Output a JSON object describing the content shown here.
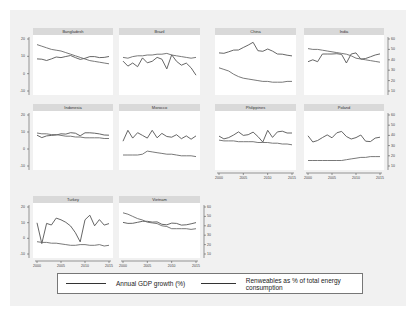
{
  "chart_data": {
    "type": "line",
    "title": "",
    "layout": "small multiples, 4 columns x 3 rows, dual y-axes",
    "x": [
      2000,
      2001,
      2002,
      2003,
      2004,
      2005,
      2006,
      2007,
      2008,
      2009,
      2010,
      2011,
      2012,
      2013,
      2014,
      2015
    ],
    "xticks": [
      "2000",
      "2005",
      "2010",
      "2015"
    ],
    "left_yticks": [
      "20",
      "10",
      "0",
      "-10"
    ],
    "right_yticks": [
      "60",
      "50",
      "40",
      "30",
      "20",
      "10"
    ],
    "legend": {
      "position": "bottom",
      "entries": [
        "Annual GDP growth (%)",
        "Renweables as % of total energy consumption"
      ]
    },
    "panels": [
      {
        "name": "Bangladesh",
        "series": [
          {
            "name": "Annual GDP growth (%)",
            "values": [
              5.3,
              5.1,
              4.4,
              5.3,
              6.3,
              6.0,
              6.6,
              7.1,
              6.0,
              5.0,
              5.6,
              6.5,
              6.5,
              6.0,
              6.1,
              6.6
            ]
          },
          {
            "name": "Renweables as % of total energy consumption",
            "values": [
              58,
              56,
              54,
              52,
              51,
              50,
              48,
              46,
              44,
              42,
              40,
              38,
              37,
              36,
              35,
              34
            ]
          }
        ]
      },
      {
        "name": "Brazil",
        "series": [
          {
            "name": "Annual GDP growth (%)",
            "values": [
              4.1,
              1.4,
              3.1,
              1.1,
              5.8,
              3.2,
              4.0,
              6.1,
              5.1,
              -0.1,
              7.5,
              4.0,
              1.9,
              3.0,
              0.5,
              -3.5
            ]
          },
          {
            "name": "Renweables as % of total energy consumption",
            "values": [
              42,
              41,
              43,
              44,
              44,
              45,
              45,
              46,
              46,
              47,
              45,
              44,
              43,
              42,
              41,
              42
            ]
          }
        ]
      },
      {
        "name": "China",
        "series": [
          {
            "name": "Annual GDP growth (%)",
            "values": [
              8.5,
              8.3,
              9.1,
              10.0,
              10.1,
              11.4,
              12.7,
              14.2,
              9.7,
              9.4,
              10.6,
              9.5,
              7.9,
              7.8,
              7.3,
              6.9
            ]
          },
          {
            "name": "Renweables as % of total energy consumption",
            "values": [
              29,
              27,
              25,
              21,
              18,
              16,
              15,
              14,
              13,
              12,
              12,
              11,
              11,
              11,
              12,
              12
            ]
          }
        ]
      },
      {
        "name": "India",
        "series": [
          {
            "name": "Annual GDP growth (%)",
            "values": [
              3.8,
              4.8,
              3.8,
              7.9,
              7.9,
              7.9,
              8.1,
              7.7,
              3.1,
              7.9,
              8.5,
              5.2,
              5.5,
              6.4,
              7.4,
              8.0
            ]
          },
          {
            "name": "Renweables as % of total energy consumption",
            "values": [
              53,
              52,
              52,
              51,
              50,
              49,
              48,
              47,
              46,
              44,
              41,
              40,
              39,
              38,
              37,
              36
            ]
          }
        ]
      },
      {
        "name": "Indonesia",
        "series": [
          {
            "name": "Annual GDP growth (%)",
            "values": [
              4.9,
              3.6,
              4.5,
              4.8,
              5.0,
              5.7,
              5.5,
              6.3,
              6.0,
              4.6,
              6.2,
              6.2,
              6.0,
              5.6,
              5.0,
              4.9
            ]
          },
          {
            "name": "Renweables as % of total energy consumption",
            "values": [
              42,
              41,
              41,
              40,
              40,
              39,
              38,
              38,
              37,
              37,
              36,
              36,
              36,
              36,
              35,
              35
            ]
          }
        ]
      },
      {
        "name": "Morocco",
        "series": [
          {
            "name": "Annual GDP growth (%)",
            "values": [
              1.6,
              7.6,
              3.3,
              6.3,
              4.8,
              3.3,
              7.6,
              3.5,
              5.9,
              4.2,
              3.8,
              5.2,
              3.0,
              4.5,
              2.7,
              4.5
            ]
          },
          {
            "name": "Renweables as % of total energy consumption",
            "values": [
              14,
              14,
              14,
              14,
              15,
              19,
              18,
              17,
              16,
              15,
              15,
              14,
              13,
              13,
              13,
              12
            ]
          }
        ]
      },
      {
        "name": "Philippines",
        "series": [
          {
            "name": "Annual GDP growth (%)",
            "values": [
              4.4,
              2.9,
              3.6,
              5.0,
              6.7,
              4.8,
              5.2,
              6.6,
              4.2,
              1.1,
              7.6,
              3.7,
              6.7,
              7.1,
              6.1,
              6.1
            ]
          },
          {
            "name": "Renweables as % of total energy consumption",
            "values": [
              33,
              32,
              32,
              32,
              31,
              31,
              31,
              31,
              30,
              30,
              30,
              29,
              29,
              28,
              28,
              27
            ]
          }
        ]
      },
      {
        "name": "Poland",
        "series": [
          {
            "name": "Annual GDP growth (%)",
            "values": [
              4.6,
              1.2,
              2.0,
              3.6,
              5.1,
              3.5,
              6.2,
              7.0,
              4.2,
              2.8,
              3.6,
              5.0,
              1.6,
              1.4,
              3.3,
              3.8
            ]
          },
          {
            "name": "Renweables as % of total energy consumption",
            "values": [
              7,
              7,
              7,
              7,
              7,
              7,
              7,
              7,
              8,
              9,
              10,
              11,
              11,
              12,
              12,
              12
            ]
          }
        ]
      },
      {
        "name": "Turkey",
        "series": [
          {
            "name": "Annual GDP growth (%)",
            "values": [
              6.6,
              -5.8,
              6.2,
              5.3,
              9.4,
              8.4,
              6.9,
              4.7,
              0.7,
              -4.8,
              8.4,
              11.1,
              4.8,
              8.5,
              5.2,
              6.1
            ]
          },
          {
            "name": "Renweables as % of total energy consumption",
            "values": [
              17,
              16,
              16,
              15,
              15,
              14,
              13,
              12,
              12,
              13,
              13,
              12,
              12,
              13,
              11,
              12
            ]
          }
        ]
      },
      {
        "name": "Vietnam",
        "series": [
          {
            "name": "Annual GDP growth (%)",
            "values": [
              6.8,
              6.2,
              6.3,
              6.9,
              7.5,
              7.5,
              7.0,
              7.1,
              5.7,
              5.4,
              6.4,
              6.2,
              5.2,
              5.4,
              6.0,
              6.7
            ]
          },
          {
            "name": "Renweables as % of total energy consumption",
            "values": [
              57,
              55,
              52,
              49,
              47,
              44,
              43,
              42,
              39,
              38,
              35,
              35,
              35,
              35,
              34,
              35
            ]
          }
        ]
      }
    ]
  },
  "panels": [
    {
      "title": "Bangladesh"
    },
    {
      "title": "Brazil"
    },
    {
      "title": "China"
    },
    {
      "title": "India"
    },
    {
      "title": "Indonesia"
    },
    {
      "title": "Morocco"
    },
    {
      "title": "Philippines"
    },
    {
      "title": "Poland"
    },
    {
      "title": "Turkey"
    },
    {
      "title": "Vietnam"
    }
  ],
  "axes": {
    "left_ticks": [
      "20",
      "10",
      "0",
      "-10"
    ],
    "right_ticks": [
      "60",
      "50",
      "40",
      "30",
      "20",
      "10"
    ],
    "x_ticks": [
      "2000",
      "2005",
      "2010",
      "2015"
    ]
  },
  "legend": {
    "gdp_label": "Annual GDP growth (%)",
    "renew_label": "Renweables as % of total energy consumption"
  }
}
